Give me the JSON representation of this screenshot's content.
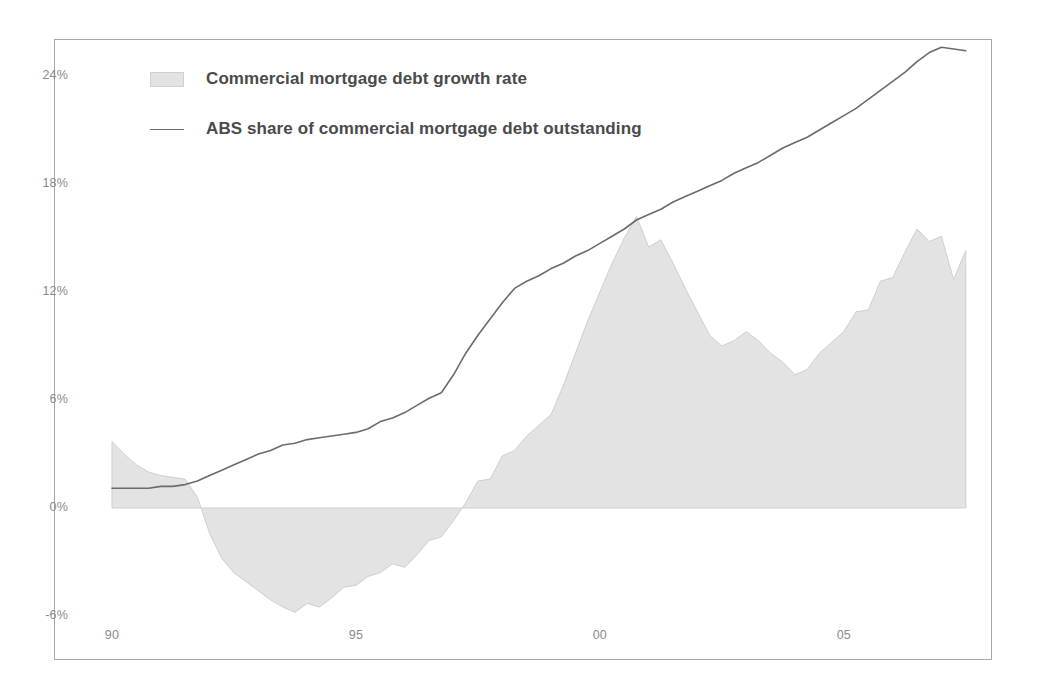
{
  "chart_data": {
    "type": "area",
    "title": "",
    "subtitle": "",
    "xlabel": "",
    "ylabel": "",
    "grid": false,
    "legend_position": "top-left",
    "xlim": [
      1990,
      2007.75
    ],
    "ylim": [
      -7.5,
      26.5
    ],
    "y_ticks": [
      "24%",
      "18%",
      "12%",
      "6%",
      "0%",
      "-6%"
    ],
    "y_tick_values": [
      24,
      18,
      12,
      6,
      0,
      -6
    ],
    "x_ticks": [
      "90",
      "95",
      "00",
      "05"
    ],
    "x_tick_values": [
      1990,
      1995,
      2000,
      2005
    ],
    "colors": {
      "area_fill": "#e3e3e3",
      "area_edge": "#cfcfcf",
      "line": "#6b6b6b",
      "axis_text": "#8a8a8a",
      "legend_text": "#4a4a4a",
      "frame": "#a9a9a9",
      "background": "#ffffff"
    },
    "series": [
      {
        "name": "Commercial mortgage debt growth rate",
        "type": "area",
        "x": [
          1990.0,
          1990.25,
          1990.5,
          1990.75,
          1991.0,
          1991.25,
          1991.5,
          1991.75,
          1992.0,
          1992.25,
          1992.5,
          1992.75,
          1993.0,
          1993.25,
          1993.5,
          1993.75,
          1994.0,
          1994.25,
          1994.5,
          1994.75,
          1995.0,
          1995.25,
          1995.5,
          1995.75,
          1996.0,
          1996.25,
          1996.5,
          1996.75,
          1997.0,
          1997.25,
          1997.5,
          1997.75,
          1998.0,
          1998.25,
          1998.5,
          1998.75,
          1999.0,
          1999.25,
          1999.5,
          1999.75,
          2000.0,
          2000.25,
          2000.5,
          2000.75,
          2001.0,
          2001.25,
          2001.5,
          2001.75,
          2002.0,
          2002.25,
          2002.5,
          2002.75,
          2003.0,
          2003.25,
          2003.5,
          2003.75,
          2004.0,
          2004.25,
          2004.5,
          2004.75,
          2005.0,
          2005.25,
          2005.5,
          2005.75,
          2006.0,
          2006.25,
          2006.5,
          2006.75,
          2007.0,
          2007.25,
          2007.5
        ],
        "values": [
          3.7,
          3.0,
          2.4,
          2.0,
          1.8,
          1.7,
          1.6,
          0.6,
          -1.4,
          -2.8,
          -3.6,
          -4.1,
          -4.6,
          -5.1,
          -5.5,
          -5.8,
          -5.3,
          -5.5,
          -5.0,
          -4.4,
          -4.3,
          -3.8,
          -3.6,
          -3.1,
          -3.3,
          -2.6,
          -1.8,
          -1.6,
          -0.7,
          0.3,
          1.5,
          1.6,
          2.9,
          3.2,
          4.0,
          4.6,
          5.2,
          6.8,
          8.6,
          10.4,
          12.0,
          13.6,
          15.0,
          16.2,
          14.5,
          14.9,
          13.6,
          12.2,
          10.9,
          9.6,
          9.0,
          9.3,
          9.8,
          9.3,
          8.6,
          8.1,
          7.4,
          7.7,
          8.6,
          9.2,
          9.8,
          10.9,
          11.0,
          12.6,
          12.8,
          14.2,
          15.5,
          14.8,
          15.1,
          12.7,
          14.3
        ]
      },
      {
        "name": "ABS share of commercial mortgage debt outstanding",
        "type": "line",
        "x": [
          1990.0,
          1990.25,
          1990.5,
          1990.75,
          1991.0,
          1991.25,
          1991.5,
          1991.75,
          1992.0,
          1992.25,
          1992.5,
          1992.75,
          1993.0,
          1993.25,
          1993.5,
          1993.75,
          1994.0,
          1994.25,
          1994.5,
          1994.75,
          1995.0,
          1995.25,
          1995.5,
          1995.75,
          1996.0,
          1996.25,
          1996.5,
          1996.75,
          1997.0,
          1997.25,
          1997.5,
          1997.75,
          1998.0,
          1998.25,
          1998.5,
          1998.75,
          1999.0,
          1999.25,
          1999.5,
          1999.75,
          2000.0,
          2000.25,
          2000.5,
          2000.75,
          2001.0,
          2001.25,
          2001.5,
          2001.75,
          2002.0,
          2002.25,
          2002.5,
          2002.75,
          2003.0,
          2003.25,
          2003.5,
          2003.75,
          2004.0,
          2004.25,
          2004.5,
          2004.75,
          2005.0,
          2005.25,
          2005.5,
          2005.75,
          2006.0,
          2006.25,
          2006.5,
          2006.75,
          2007.0,
          2007.25,
          2007.5
        ],
        "values": [
          1.1,
          1.1,
          1.1,
          1.1,
          1.2,
          1.2,
          1.3,
          1.5,
          1.8,
          2.1,
          2.4,
          2.7,
          3.0,
          3.2,
          3.5,
          3.6,
          3.8,
          3.9,
          4.0,
          4.1,
          4.2,
          4.4,
          4.8,
          5.0,
          5.3,
          5.7,
          6.1,
          6.4,
          7.4,
          8.6,
          9.6,
          10.5,
          11.4,
          12.2,
          12.6,
          12.9,
          13.3,
          13.6,
          14.0,
          14.3,
          14.7,
          15.1,
          15.5,
          16.0,
          16.3,
          16.6,
          17.0,
          17.3,
          17.6,
          17.9,
          18.2,
          18.6,
          18.9,
          19.2,
          19.6,
          20.0,
          20.3,
          20.6,
          21.0,
          21.4,
          21.8,
          22.2,
          22.7,
          23.2,
          23.7,
          24.2,
          24.8,
          25.3,
          25.6,
          25.5,
          25.4
        ]
      }
    ]
  },
  "legend": {
    "items": [
      {
        "label": "Commercial mortgage debt growth rate",
        "marker": "area-swatch"
      },
      {
        "label": "ABS share of commercial mortgage debt outstanding",
        "marker": "line-swatch"
      }
    ]
  }
}
